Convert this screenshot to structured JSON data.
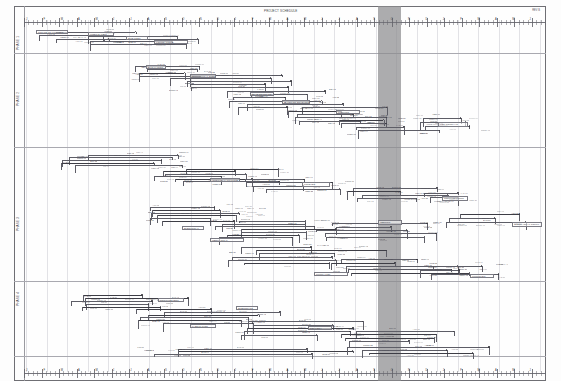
{
  "document": {
    "kind": "construction-cpm-network-schedule",
    "sheet_title": "PROJECT SCHEDULE",
    "corner_code": "REV B",
    "orientation": "landscape"
  },
  "highlight": {
    "name": "data-date-band",
    "label": "DATA DATE",
    "color": "#8c8c8f",
    "x": 364,
    "width": 23
  },
  "colors": {
    "paper": "#fefefe",
    "frame": "#6f6f74",
    "rule": "#a9a9b0",
    "grid": "#e2e2e6",
    "ink": "#4a4a52",
    "band": "#8c8c8f"
  },
  "lanes": [
    {
      "label": "A",
      "y": 0,
      "height": 47
    },
    {
      "label": "B",
      "y": 47,
      "height": 94
    },
    {
      "label": "C",
      "y": 141,
      "height": 134
    },
    {
      "label": "D",
      "y": 275,
      "height": 80
    }
  ],
  "lane_rules": [
    47,
    141,
    275,
    350
  ],
  "scale_top": {
    "name": "timescale-top",
    "ticks": 120,
    "labels": [
      "J",
      "F",
      "M",
      "A",
      "M",
      "J",
      "J",
      "A",
      "S",
      "O",
      "N",
      "D",
      "J",
      "F",
      "M",
      "A",
      "M",
      "J",
      "J",
      "A",
      "S",
      "O",
      "N",
      "D",
      "J",
      "F",
      "M",
      "A",
      "M",
      "J"
    ]
  },
  "scale_bottom": {
    "name": "timescale-bottom",
    "ticks": 120,
    "labels": [
      "J",
      "F",
      "M",
      "A",
      "M",
      "J",
      "J",
      "A",
      "S",
      "O",
      "N",
      "D",
      "J",
      "F",
      "M",
      "A",
      "M",
      "J",
      "J",
      "A",
      "S",
      "O",
      "N",
      "D",
      "J",
      "F",
      "M",
      "A",
      "M",
      "J"
    ]
  },
  "vgrid_count": 26,
  "network": {
    "description": "Cascading logic network of activity bars, nodes and link lines descending left-to-right across four swimlanes.",
    "clusters": [
      {
        "x": 18,
        "y": 22,
        "w": 96,
        "h": 14,
        "density": 14,
        "bars": 3
      },
      {
        "x": 64,
        "y": 28,
        "w": 120,
        "h": 12,
        "density": 16,
        "bars": 4
      },
      {
        "x": 112,
        "y": 57,
        "w": 88,
        "h": 16,
        "density": 18,
        "bars": 4
      },
      {
        "x": 150,
        "y": 66,
        "w": 110,
        "h": 18,
        "density": 20,
        "bars": 5
      },
      {
        "x": 212,
        "y": 82,
        "w": 108,
        "h": 22,
        "density": 26,
        "bars": 6
      },
      {
        "x": 268,
        "y": 98,
        "w": 100,
        "h": 20,
        "density": 24,
        "bars": 5
      },
      {
        "x": 320,
        "y": 110,
        "w": 96,
        "h": 18,
        "density": 20,
        "bars": 4
      },
      {
        "x": 398,
        "y": 108,
        "w": 70,
        "h": 16,
        "density": 12,
        "bars": 3
      },
      {
        "x": 46,
        "y": 146,
        "w": 120,
        "h": 16,
        "density": 20,
        "bars": 5
      },
      {
        "x": 140,
        "y": 160,
        "w": 130,
        "h": 18,
        "density": 24,
        "bars": 6
      },
      {
        "x": 230,
        "y": 170,
        "w": 110,
        "h": 16,
        "density": 18,
        "bars": 4
      },
      {
        "x": 330,
        "y": 178,
        "w": 100,
        "h": 18,
        "density": 16,
        "bars": 4
      },
      {
        "x": 404,
        "y": 182,
        "w": 60,
        "h": 14,
        "density": 10,
        "bars": 2
      },
      {
        "x": 128,
        "y": 198,
        "w": 120,
        "h": 20,
        "density": 26,
        "bars": 6
      },
      {
        "x": 196,
        "y": 212,
        "w": 140,
        "h": 22,
        "density": 30,
        "bars": 7
      },
      {
        "x": 300,
        "y": 214,
        "w": 120,
        "h": 20,
        "density": 22,
        "bars": 5
      },
      {
        "x": 430,
        "y": 204,
        "w": 90,
        "h": 16,
        "density": 12,
        "bars": 3
      },
      {
        "x": 214,
        "y": 238,
        "w": 140,
        "h": 22,
        "density": 28,
        "bars": 6
      },
      {
        "x": 306,
        "y": 250,
        "w": 130,
        "h": 20,
        "density": 24,
        "bars": 5
      },
      {
        "x": 404,
        "y": 256,
        "w": 86,
        "h": 16,
        "density": 12,
        "bars": 3
      },
      {
        "x": 56,
        "y": 286,
        "w": 110,
        "h": 18,
        "density": 20,
        "bars": 5
      },
      {
        "x": 118,
        "y": 300,
        "w": 130,
        "h": 20,
        "density": 24,
        "bars": 6
      },
      {
        "x": 216,
        "y": 312,
        "w": 130,
        "h": 20,
        "density": 22,
        "bars": 5
      },
      {
        "x": 316,
        "y": 322,
        "w": 110,
        "h": 16,
        "density": 16,
        "bars": 4
      },
      {
        "x": 120,
        "y": 340,
        "w": 200,
        "h": 10,
        "density": 16,
        "bars": 3
      },
      {
        "x": 330,
        "y": 338,
        "w": 150,
        "h": 12,
        "density": 14,
        "bars": 3
      }
    ],
    "callout_boxes": [
      {
        "x": 22,
        "y": 24,
        "w": 32,
        "h": 4,
        "text": "NOTICE TO PROCEED"
      },
      {
        "x": 74,
        "y": 26,
        "w": 26,
        "h": 4,
        "text": "MOBILIZATION"
      },
      {
        "x": 112,
        "y": 30,
        "w": 22,
        "h": 4,
        "text": "SITE PREP"
      },
      {
        "x": 140,
        "y": 34,
        "w": 34,
        "h": 4,
        "text": "FOUNDATIONS"
      },
      {
        "x": 132,
        "y": 59,
        "w": 20,
        "h": 4,
        "text": "EXCAVATION"
      },
      {
        "x": 176,
        "y": 68,
        "w": 26,
        "h": 4,
        "text": "STRUCTURAL STEEL"
      },
      {
        "x": 236,
        "y": 86,
        "w": 24,
        "h": 4,
        "text": "SLAB ON GRADE"
      },
      {
        "x": 268,
        "y": 94,
        "w": 28,
        "h": 4,
        "text": "EXTERIOR ENVELOPE"
      },
      {
        "x": 322,
        "y": 104,
        "w": 24,
        "h": 4,
        "text": "ROOFING"
      },
      {
        "x": 424,
        "y": 116,
        "w": 30,
        "h": 5,
        "text": "MEP ROUGH-IN"
      },
      {
        "x": 196,
        "y": 172,
        "w": 30,
        "h": 4,
        "text": "INTERIOR PARTITIONS"
      },
      {
        "x": 288,
        "y": 176,
        "w": 28,
        "h": 5,
        "text": "FINISHES"
      },
      {
        "x": 428,
        "y": 190,
        "w": 26,
        "h": 5,
        "text": "COMMISSIONING"
      },
      {
        "x": 168,
        "y": 220,
        "w": 22,
        "h": 4,
        "text": "ELECTRICAL"
      },
      {
        "x": 196,
        "y": 232,
        "w": 34,
        "h": 4,
        "text": "MECHANICAL"
      },
      {
        "x": 364,
        "y": 214,
        "w": 24,
        "h": 5,
        "text": "TESTING"
      },
      {
        "x": 498,
        "y": 216,
        "w": 30,
        "h": 5,
        "text": "SUBSTANTIAL COMPL"
      },
      {
        "x": 300,
        "y": 266,
        "w": 34,
        "h": 4,
        "text": "PUNCH LIST"
      },
      {
        "x": 456,
        "y": 268,
        "w": 24,
        "h": 4,
        "text": "TURNOVER"
      },
      {
        "x": 144,
        "y": 292,
        "w": 26,
        "h": 4,
        "text": "PROCUREMENT"
      },
      {
        "x": 222,
        "y": 300,
        "w": 22,
        "h": 4,
        "text": "SUBMITTALS"
      },
      {
        "x": 176,
        "y": 318,
        "w": 26,
        "h": 4,
        "text": "FABRICATION"
      },
      {
        "x": 294,
        "y": 320,
        "w": 24,
        "h": 4,
        "text": "DELIVERY"
      }
    ]
  },
  "left_margin_labels": [
    {
      "y": 44,
      "text": "PHASE 1"
    },
    {
      "y": 100,
      "text": "PHASE 2"
    },
    {
      "y": 225,
      "text": "PHASE 3"
    },
    {
      "y": 300,
      "text": "PHASE 4"
    }
  ]
}
